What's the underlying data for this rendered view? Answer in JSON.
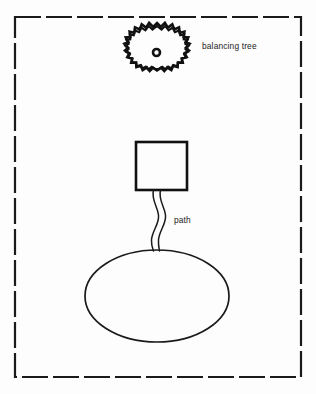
{
  "diagram": {
    "background_color": "#fdfdfd",
    "ink_color": "#1a1a1a",
    "boundary": {
      "name": "site boundary",
      "style": "dashed rectangle",
      "x": 15,
      "y": 17,
      "width": 286,
      "height": 360,
      "dash_length": 26,
      "gap_length": 5,
      "stroke_width": 2.2
    },
    "labels": {
      "tree": "balancing tree",
      "path": "path"
    },
    "features": [
      {
        "key": "tree",
        "name": "balancing tree",
        "shape": "spiky circle with center dot",
        "center_x": 157,
        "center_y": 53,
        "radius": 30,
        "trunk_radius": 3.6,
        "label": "balancing tree",
        "label_x": 202,
        "label_y": 49
      },
      {
        "key": "building",
        "name": "building",
        "shape": "square",
        "x": 136,
        "y": 142,
        "width": 51,
        "height": 48,
        "stroke_width": 2.6
      },
      {
        "key": "path",
        "name": "path",
        "shape": "double wavy line",
        "from": "building",
        "to": "pond",
        "label": "path",
        "label_x": 174,
        "label_y": 223
      },
      {
        "key": "pond",
        "name": "pond",
        "shape": "ellipse",
        "center_x": 157,
        "center_y": 296,
        "radius_x": 72,
        "radius_y": 46,
        "stroke_width": 1.7
      }
    ]
  }
}
